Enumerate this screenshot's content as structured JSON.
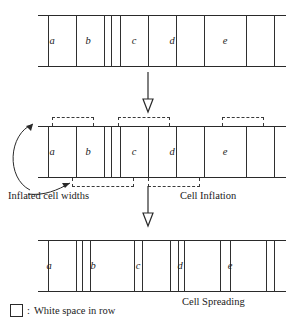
{
  "figure": {
    "line_color": "#2a2a2a",
    "dash_color": "#3a3a3a",
    "cell_fill": "#ffffff"
  },
  "rows": [
    {
      "id": "row-original",
      "name": "original-row",
      "top": 15,
      "height": 52,
      "dividers": [
        10,
        38,
        66,
        73,
        82,
        110,
        138,
        166,
        208,
        236
      ],
      "cells": [
        {
          "label": "a",
          "cx": 52,
          "cy": 41
        },
        {
          "label": "b",
          "cx": 88,
          "cy": 41
        },
        {
          "label": "c",
          "cx": 134,
          "cy": 41
        },
        {
          "label": "d",
          "cx": 172,
          "cy": 41
        },
        {
          "label": "e",
          "cx": 225,
          "cy": 41
        }
      ]
    },
    {
      "id": "row-inflated",
      "name": "inflated-row",
      "top": 126,
      "height": 52,
      "dividers": [
        10,
        38,
        66,
        73,
        82,
        110,
        138,
        166,
        208,
        236
      ],
      "cells": [
        {
          "label": "a",
          "cx": 52,
          "cy": 152
        },
        {
          "label": "b",
          "cx": 88,
          "cy": 152
        },
        {
          "label": "c",
          "cx": 134,
          "cy": 152
        },
        {
          "label": "d",
          "cx": 172,
          "cy": 152
        },
        {
          "label": "e",
          "cx": 225,
          "cy": 152
        }
      ]
    },
    {
      "id": "row-spread",
      "name": "spread-row",
      "top": 240,
      "height": 52,
      "dividers": [
        10,
        38,
        44,
        52,
        96,
        104,
        132,
        140,
        146,
        182,
        192,
        228,
        236
      ],
      "cells": [
        {
          "label": "a",
          "cx": 49,
          "cy": 266
        },
        {
          "label": "b",
          "cx": 93,
          "cy": 266
        },
        {
          "label": "c",
          "cx": 138,
          "cy": 266
        },
        {
          "label": "d",
          "cx": 180,
          "cy": 266
        },
        {
          "label": "e",
          "cx": 230,
          "cy": 266
        }
      ]
    }
  ],
  "brackets": {
    "above": [
      {
        "name": "inflated-width-bracket-a",
        "left": 52,
        "width": 42
      },
      {
        "name": "inflated-width-bracket-c",
        "left": 118,
        "width": 52
      },
      {
        "name": "inflated-width-bracket-e",
        "left": 222,
        "width": 42
      }
    ],
    "below": [
      {
        "name": "inflated-width-bracket-b",
        "left": 72,
        "width": 62
      },
      {
        "name": "inflated-width-bracket-d",
        "left": 148,
        "width": 52
      }
    ]
  },
  "captions": {
    "inflated_cell_widths": "Inflated cell widths",
    "cell_inflation": "Cell Inflation",
    "cell_spreading": "Cell Spreading"
  },
  "legend": {
    "separator": ":",
    "white_space_label": "White space in row"
  },
  "arrows": {
    "inflation_arrow": "down-arrow-inflation",
    "spreading_arrow": "down-arrow-spreading",
    "callout_upper": "curved-callout-upper",
    "callout_lower": "curved-callout-lower"
  }
}
